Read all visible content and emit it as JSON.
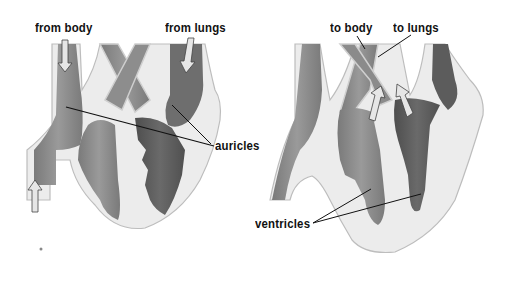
{
  "diagram": {
    "colors": {
      "outline": "#c8c8c8",
      "wall": "#e8e8e8",
      "blood_medium": "#8a8a8a",
      "blood_dark": "#5e5e5e",
      "text": "#111111",
      "background": "#ffffff"
    },
    "left_heart": {
      "labels": {
        "from_body": "from body",
        "from_lungs": "from lungs",
        "auricles": "auricles"
      },
      "arrows": [
        "down-arrow-from-body",
        "down-arrow-from-lungs",
        "up-arrow-lower-vein"
      ]
    },
    "right_heart": {
      "labels": {
        "to_body": "to body",
        "to_lungs": "to lungs",
        "ventricles": "ventricles"
      },
      "arrows": [
        "up-arrow-to-body",
        "up-arrow-to-lungs"
      ]
    }
  }
}
